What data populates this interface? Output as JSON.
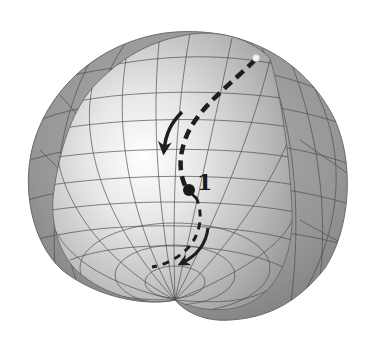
{
  "figure": {
    "type": "3d-surface-diagram",
    "colors": {
      "background": "#ffffff",
      "outer_surface": "#8c8c8c",
      "inner_surface_light": "#f4f4f4",
      "inner_surface_dark": "#a8a8a8",
      "mesh_lines": "#4a4a4a",
      "trajectory": "#1e1e1e",
      "start_point": "#f2f2f2",
      "marked_point": "#1a1a1a"
    },
    "point_label": "1",
    "elements": {
      "start_point": "light dot at top-right of surface",
      "upper_arrow": "solid curved arrow pointing down-left",
      "lower_arrow": "solid curved arrow pointing down-left",
      "dashed_path": "thick dashed curve from start point through point 1 to the cusp region"
    }
  }
}
